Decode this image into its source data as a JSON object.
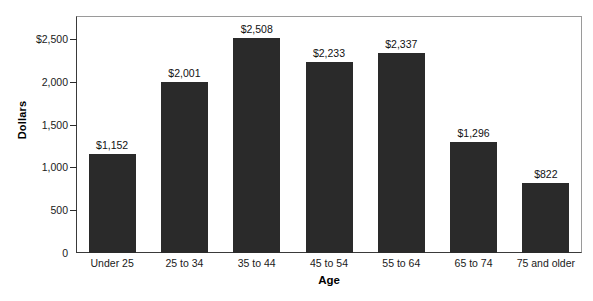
{
  "chart_data": {
    "type": "bar",
    "title": "",
    "xlabel": "Age",
    "ylabel": "Dollars",
    "categories": [
      "Under 25",
      "25 to 34",
      "35 to 44",
      "45 to 54",
      "55 to 64",
      "65 to 74",
      "75 and older"
    ],
    "values": [
      1152,
      2001,
      2508,
      2233,
      2337,
      1296,
      822
    ],
    "value_labels": [
      "$1,152",
      "$2,001",
      "$2,508",
      "$2,233",
      "$2,337",
      "$1,296",
      "$822"
    ],
    "ylim": [
      0,
      2770
    ],
    "yticks": [
      0,
      500,
      1000,
      1500,
      2000,
      2500
    ],
    "ytick_labels": [
      "0",
      "500",
      "1,000",
      "1,500",
      "2,000",
      "$2,500"
    ],
    "grid": false,
    "legend": null,
    "bar_color": "#2a2a2a",
    "background_color": "#ffffff",
    "frame_color": "#9a9a9a"
  }
}
